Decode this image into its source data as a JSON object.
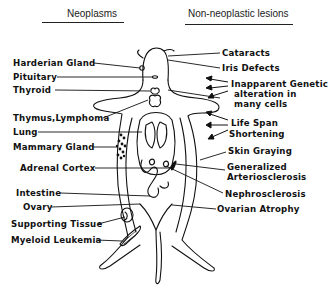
{
  "headers": {
    "left": "Neoplasms",
    "right": "Non-neoplastic lesions"
  },
  "neoplasms": [
    {
      "label": "Harderian Gland",
      "x": 13,
      "y": 58
    },
    {
      "label": "Pituitary",
      "x": 13,
      "y": 72
    },
    {
      "label": "Thyroid",
      "x": 13,
      "y": 86
    },
    {
      "label": "Thymus,Lymphoma",
      "x": 13,
      "y": 113
    },
    {
      "label": "Lung",
      "x": 13,
      "y": 127
    },
    {
      "label": "Mammary Gland",
      "x": 13,
      "y": 142
    },
    {
      "label": "Adrenal Cortex",
      "x": 20,
      "y": 163
    },
    {
      "label": "Intestine",
      "x": 16,
      "y": 190
    },
    {
      "label": "Ovary",
      "x": 23,
      "y": 203
    },
    {
      "label": "Supporting Tissue",
      "x": 11,
      "y": 218
    },
    {
      "label": "Myeloid Leukemia",
      "x": 11,
      "y": 234
    }
  ],
  "non_neoplastic": [
    {
      "label": "Cataracts",
      "x": 222,
      "y": 48
    },
    {
      "label": "Iris Defects",
      "x": 222,
      "y": 63
    },
    {
      "label": "Inapparent Genetic",
      "x": 231,
      "y": 80
    },
    {
      "label": "alteration in",
      "x": 234,
      "y": 90
    },
    {
      "label": "many cells",
      "x": 234,
      "y": 101
    },
    {
      "label": "Life Span",
      "x": 231,
      "y": 120
    },
    {
      "label": "Shortening",
      "x": 229,
      "y": 131
    },
    {
      "label": "Skin Graying",
      "x": 228,
      "y": 148
    },
    {
      "label": "Generalized",
      "x": 227,
      "y": 164
    },
    {
      "label": "Arteriosclerosis",
      "x": 227,
      "y": 175
    },
    {
      "label": "Nephrosclerosis",
      "x": 225,
      "y": 190
    },
    {
      "label": "Ovarian Atrophy",
      "x": 217,
      "y": 205
    }
  ]
}
